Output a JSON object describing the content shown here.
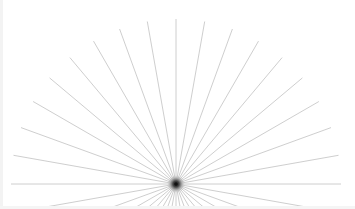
{
  "figure": {
    "center": {
      "x": 176,
      "y": 184
    },
    "ray_count": 36,
    "ray_angle_step_deg": 10,
    "ray_length": 165,
    "lower_clip_y": 206,
    "colors": {
      "background": "#ffffff",
      "ray": "#c8c8c8",
      "center_dot": "#111111",
      "center_glow": "#9a9a9a",
      "edge": "#f3f3f3"
    }
  }
}
